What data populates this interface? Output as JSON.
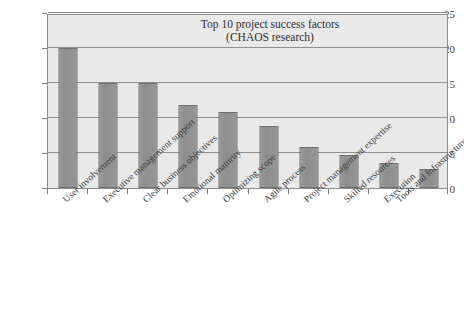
{
  "chart_data": {
    "type": "bar",
    "title": "Top 10 project success factors",
    "subtitle": "(CHAOS research)",
    "xlabel": "",
    "ylabel": "",
    "ylim": [
      0,
      25
    ],
    "ytick_values": [
      0,
      5,
      10,
      15,
      20,
      25
    ],
    "ytick_labels": [
      "0",
      "5",
      "10",
      "15",
      "20",
      "25"
    ],
    "grid": true,
    "legend": false,
    "categories": [
      "User involvement",
      "Executive management support",
      "Clear business objectives",
      "Emotional maturity",
      "Optimizing scope",
      "Agile process",
      "Project management expertise",
      "Skilled resources",
      "Execution",
      "Tools and Infrastructure"
    ],
    "values": [
      20,
      15,
      15,
      11.8,
      10.8,
      8.8,
      5.8,
      4.7,
      3.6,
      2.7
    ],
    "colors": {
      "bar_fill": "#8f8f8f",
      "bar_border": "#6e6e6e",
      "plot_background": "#e9e9e9",
      "grid_line": "#8e8e8e",
      "axis_line": "#8c8c8c",
      "text": "#3d3d3d",
      "page_background": "#ffffff"
    }
  }
}
